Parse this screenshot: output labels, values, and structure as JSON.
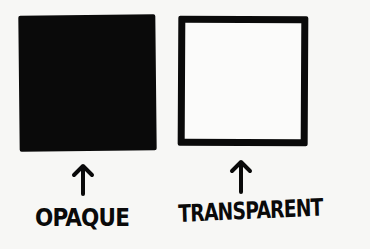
{
  "diagram": {
    "items": [
      {
        "label": "OPAQUE",
        "shape": "filled-square",
        "fill": "#0a0a0a"
      },
      {
        "label": "TRANSPARENT",
        "shape": "outlined-square",
        "stroke": "#0a0a0a",
        "fill": "#fbfbfa"
      }
    ],
    "background": "#f7f7f5"
  }
}
